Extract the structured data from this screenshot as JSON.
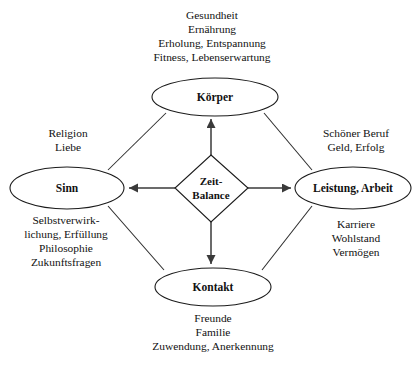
{
  "diagram": {
    "type": "balance-model",
    "colors": {
      "background": "#ffffff",
      "stroke": "#1b1b1b",
      "arrow": "#3a3a3a",
      "text": "#111111"
    },
    "center": {
      "name": "zeit-balance",
      "shape": "diamond",
      "lines": [
        "Zeit-",
        "Balance"
      ]
    },
    "nodes": [
      {
        "id": "koerper",
        "label": "Körper",
        "shape": "ellipse",
        "position": "top",
        "caption_position": "above",
        "caption_lines": [
          "Gesundheit",
          "Ernährung",
          "Erholung, Entspannung",
          "Fitness, Lebenserwartung"
        ]
      },
      {
        "id": "sinn",
        "label": "Sinn",
        "shape": "ellipse",
        "position": "left",
        "caption_position": "above-and-below",
        "caption_lines_above": [
          "Religion",
          "Liebe"
        ],
        "caption_lines_below": [
          "Selbstverwirk-",
          "lichung, Erfüllung",
          "Philosophie",
          "Zukunftsfragen"
        ]
      },
      {
        "id": "leistung-arbeit",
        "label": "Leistung, Arbeit",
        "shape": "ellipse",
        "position": "right",
        "caption_position": "above-and-below",
        "caption_lines_above": [
          "Schöner Beruf",
          "Geld, Erfolg"
        ],
        "caption_lines_below": [
          "Karriere",
          "Wohlstand",
          "Vermögen"
        ]
      },
      {
        "id": "kontakt",
        "label": "Kontakt",
        "shape": "ellipse",
        "position": "bottom",
        "caption_position": "below",
        "caption_lines": [
          "Freunde",
          "Familie",
          "Zuwendung, Anerkennung"
        ]
      }
    ],
    "arrows": [
      {
        "from": "zeit-balance",
        "to": "koerper",
        "direction": "up",
        "style": "arrow"
      },
      {
        "from": "zeit-balance",
        "to": "sinn",
        "direction": "left",
        "style": "arrow"
      },
      {
        "from": "zeit-balance",
        "to": "leistung-arbeit",
        "direction": "right",
        "style": "arrow"
      },
      {
        "from": "zeit-balance",
        "to": "kontakt",
        "direction": "down",
        "style": "arrow"
      }
    ],
    "links": [
      {
        "from": "sinn",
        "to": "koerper",
        "style": "line"
      },
      {
        "from": "koerper",
        "to": "leistung-arbeit",
        "style": "line"
      },
      {
        "from": "leistung-arbeit",
        "to": "kontakt",
        "style": "line"
      },
      {
        "from": "kontakt",
        "to": "sinn",
        "style": "line"
      }
    ],
    "captions": {
      "koerper_above_0": "Gesundheit",
      "koerper_above_1": "Ernährung",
      "koerper_above_2": "Erholung, Entspannung",
      "koerper_above_3": "Fitness, Lebenserwartung",
      "sinn_above_0": "Religion",
      "sinn_above_1": "Liebe",
      "sinn_below_0": "Selbstverwirk-",
      "sinn_below_1": "lichung, Erfüllung",
      "sinn_below_2": "Philosophie",
      "sinn_below_3": "Zukunftsfragen",
      "leistung_above_0": "Schöner Beruf",
      "leistung_above_1": "Geld, Erfolg",
      "leistung_below_0": "Karriere",
      "leistung_below_1": "Wohlstand",
      "leistung_below_2": "Vermögen",
      "kontakt_below_0": "Freunde",
      "kontakt_below_1": "Familie",
      "kontakt_below_2": "Zuwendung, Anerkennung"
    },
    "node_labels": {
      "koerper": "Körper",
      "sinn": "Sinn",
      "leistung": "Leistung, Arbeit",
      "kontakt": "Kontakt",
      "center_line_1": "Zeit-",
      "center_line_2": "Balance"
    }
  }
}
